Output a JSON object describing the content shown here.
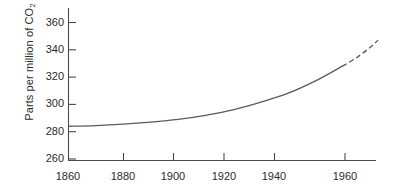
{
  "chart_data": {
    "type": "line",
    "title": "",
    "xlabel": "",
    "ylabel": "Parts per million of CO2",
    "ylabel_prefix": "Parts per million of CO",
    "ylabel_subscript": "2",
    "xlim": [
      1860,
      1973
    ],
    "ylim": [
      260,
      366
    ],
    "grid": false,
    "legend": "none",
    "x_ticks": [
      1860,
      1880,
      1900,
      1920,
      1940,
      1960
    ],
    "x_tick_labels": [
      "1860",
      "1880",
      "1900",
      "1920",
      "1940",
      "1960"
    ],
    "y_ticks": [
      260,
      280,
      300,
      320,
      340,
      360
    ],
    "y_tick_labels": [
      "260",
      "280",
      "300",
      "320",
      "340",
      "360"
    ],
    "series": [
      {
        "name": "Measured CO2 concentration",
        "style": "solid",
        "color": "#5a5a5a",
        "x": [
          1860,
          1870,
          1880,
          1890,
          1900,
          1910,
          1920,
          1930,
          1940,
          1950,
          1960
        ],
        "values": [
          284,
          284.5,
          285.5,
          287,
          289,
          292,
          296,
          301.5,
          308,
          317,
          328
        ]
      },
      {
        "name": "Projected CO2 concentration",
        "style": "dashed",
        "color": "#5a5a5a",
        "x": [
          1960,
          1965,
          1970,
          1973
        ],
        "values": [
          328,
          334,
          341.5,
          347
        ]
      }
    ]
  },
  "axes": {
    "y_axis_name": "y-axis",
    "x_axis_name": "x-axis"
  }
}
